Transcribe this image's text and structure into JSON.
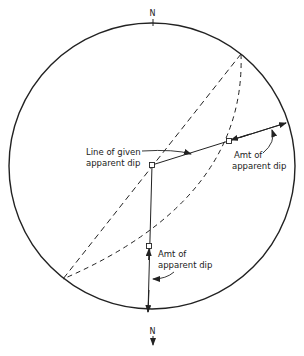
{
  "diagram": {
    "type": "stereonet-construction",
    "colors": {
      "ink": "#222222",
      "background": "#ffffff"
    },
    "labels": {
      "north_top": "N",
      "north_bottom": "N",
      "line_of_given_line1": "Line of given",
      "line_of_given_line2": "apparent dip",
      "amt_right_line1": "Amt of",
      "amt_right_line2": "apparent dip",
      "amt_bottom_line1": "Amt of",
      "amt_bottom_line2": "apparent dip"
    },
    "primitive_circle": {
      "cx": 152,
      "cy": 166,
      "r": 143
    },
    "points": {
      "center": [
        152,
        165
      ],
      "ne_strike": [
        241,
        54
      ],
      "sw_strike": [
        63,
        279
      ],
      "arc_intersection_right": [
        229,
        141
      ],
      "arc_intersection_bottom": [
        149,
        246
      ],
      "right_primitive": [
        287,
        123
      ],
      "bottom_primitive": [
        148,
        312
      ]
    }
  }
}
